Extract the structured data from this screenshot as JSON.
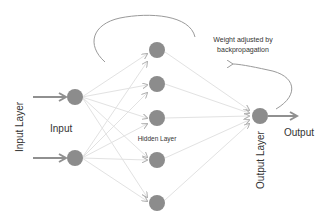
{
  "labels": {
    "input_layer": "Input Layer",
    "input": "Input",
    "hidden_layer": "Hidden Layer",
    "output_layer": "Output Layer",
    "output": "Output",
    "backprop_line1": "Weight adjusted by",
    "backprop_line2": "backpropagation"
  },
  "colors": {
    "node": "#8c8c8c",
    "edge": "#e0e0e0",
    "arrow": "#909090",
    "text": "#333333"
  },
  "layers": {
    "input_nodes": 2,
    "hidden_nodes": 5,
    "output_nodes": 1
  }
}
